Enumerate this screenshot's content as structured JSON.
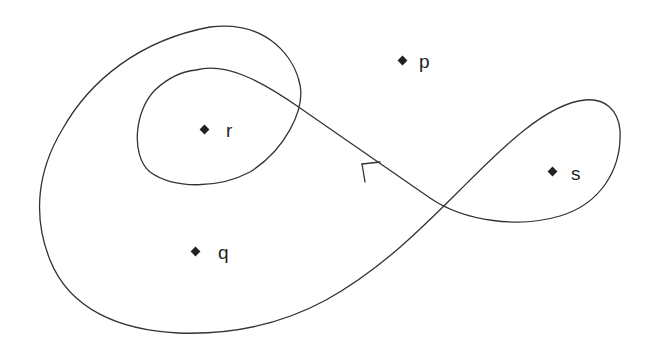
{
  "diagram": {
    "type": "closed-curve-winding",
    "points": [
      {
        "id": "p",
        "label": "p",
        "x": 403,
        "y": 61
      },
      {
        "id": "r",
        "label": "r",
        "x": 205,
        "y": 130
      },
      {
        "id": "s",
        "label": "s",
        "x": 553,
        "y": 172
      },
      {
        "id": "q",
        "label": "q",
        "x": 196,
        "y": 252
      }
    ],
    "curve": {
      "closed": true,
      "orientation_arrow": {
        "x": 362,
        "y": 163,
        "direction": "up-left"
      },
      "color": "#333333"
    }
  }
}
